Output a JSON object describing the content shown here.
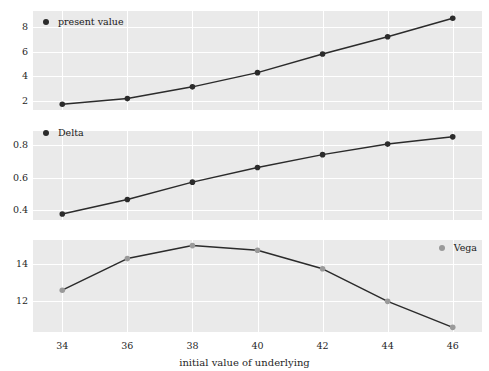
{
  "figure": {
    "width": 489,
    "height": 371,
    "background": "#ffffff",
    "panel_background": "#eaeaea",
    "gridline_color": "#ffffff",
    "line_color": "#2b2b2b",
    "marker_dark": "#2b2b2b",
    "marker_light": "#9a9a9a"
  },
  "axis": {
    "xlabel": "initial value of underlying",
    "xticks": [
      "34",
      "36",
      "38",
      "40",
      "42",
      "44",
      "46"
    ]
  },
  "chart_data": [
    {
      "type": "line",
      "title": "",
      "legend_label": "present value",
      "legend_position": "top-left",
      "series_color": "#2b2b2b",
      "xlabel": "",
      "ylabel": "",
      "x": [
        34,
        36,
        38,
        40,
        42,
        44,
        46
      ],
      "values": [
        1.75,
        2.2,
        3.15,
        4.3,
        5.8,
        7.2,
        8.7
      ],
      "xticks": [
        "34",
        "36",
        "38",
        "40",
        "42",
        "44",
        "46"
      ],
      "yticks": [
        "2",
        "4",
        "6",
        "8"
      ],
      "ytickvalues": [
        2,
        4,
        6,
        8
      ],
      "xlim": [
        33.1,
        46.9
      ],
      "ylim": [
        1.28,
        9.28
      ],
      "grid": true
    },
    {
      "type": "line",
      "title": "",
      "legend_label": "Delta",
      "legend_position": "top-left",
      "series_color": "#2b2b2b",
      "xlabel": "",
      "ylabel": "",
      "x": [
        34,
        36,
        38,
        40,
        42,
        44,
        46
      ],
      "values": [
        0.375,
        0.465,
        0.572,
        0.662,
        0.742,
        0.807,
        0.852
      ],
      "xticks": [
        "34",
        "36",
        "38",
        "40",
        "42",
        "44",
        "46"
      ],
      "yticks": [
        "0.4",
        "0.6",
        "0.8"
      ],
      "ytickvalues": [
        0.4,
        0.6,
        0.8
      ],
      "xlim": [
        33.1,
        46.9
      ],
      "ylim": [
        0.338,
        0.888
      ],
      "grid": true
    },
    {
      "type": "line",
      "title": "",
      "legend_label": "Vega",
      "legend_position": "top-right",
      "series_color": "#9a9a9a",
      "xlabel": "initial value of underlying",
      "ylabel": "",
      "x": [
        34,
        36,
        38,
        40,
        42,
        44,
        46
      ],
      "values": [
        12.6,
        14.3,
        15.0,
        14.75,
        13.75,
        12.0,
        10.6
      ],
      "xticks": [
        "34",
        "36",
        "38",
        "40",
        "42",
        "44",
        "46"
      ],
      "yticks": [
        "12",
        "14"
      ],
      "ytickvalues": [
        12,
        14
      ],
      "xlim": [
        33.1,
        46.9
      ],
      "ylim": [
        10.35,
        15.3
      ],
      "grid": true
    }
  ]
}
